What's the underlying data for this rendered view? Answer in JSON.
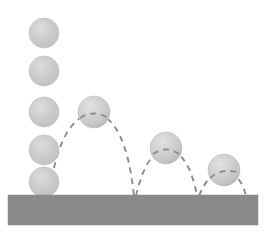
{
  "figure": {
    "width": 267,
    "height": 242,
    "background_color": "#ffffff"
  },
  "colors": {
    "ball_fill": "#c9c9c9",
    "ball_highlight": "#dedede",
    "ball_shadow": "#b4b4b4",
    "ball_edge": "#bdbdbd",
    "ground_fill": "#8a8a8a",
    "ground_edge": "#8a8a8a",
    "trajectory_stroke": "#8c8c8c"
  },
  "ground": {
    "label": "ground-surface",
    "x": 8,
    "y": 195,
    "width": 250,
    "height": 30,
    "top_y": 195
  },
  "drop_sequence": {
    "label": "free-fall-sphere-column",
    "count": 5,
    "center_x": 44,
    "radius": 15,
    "spheres": [
      {
        "name": "drop-sphere-1",
        "cx": 44,
        "cy": 33,
        "r": 15
      },
      {
        "name": "drop-sphere-2",
        "cx": 44,
        "cy": 71,
        "r": 15
      },
      {
        "name": "drop-sphere-3",
        "cx": 44,
        "cy": 112,
        "r": 15
      },
      {
        "name": "drop-sphere-4",
        "cx": 44,
        "cy": 150,
        "r": 15
      },
      {
        "name": "drop-sphere-5",
        "cx": 44,
        "cy": 182,
        "r": 15
      }
    ]
  },
  "bounce_sequence": {
    "label": "bounce-apex-spheres",
    "count": 3,
    "radius": 16,
    "spheres": [
      {
        "name": "bounce-sphere-1",
        "cx": 94,
        "cy": 112,
        "r": 16
      },
      {
        "name": "bounce-sphere-2",
        "cx": 166,
        "cy": 148,
        "r": 16
      },
      {
        "name": "bounce-sphere-3",
        "cx": 224,
        "cy": 170,
        "r": 16
      }
    ]
  },
  "impact_points": [
    {
      "name": "impact-point-1",
      "x": 44,
      "y": 195
    },
    {
      "name": "impact-point-2",
      "x": 134,
      "y": 196
    },
    {
      "name": "impact-point-3",
      "x": 197,
      "y": 196
    },
    {
      "name": "impact-point-4",
      "x": 246,
      "y": 196
    }
  ],
  "trajectories": [
    {
      "name": "arc-bounce-1",
      "start_x": 50,
      "start_y": 190,
      "apex_x": 94,
      "apex_y": 112,
      "end_x": 134,
      "end_y": 196,
      "path": "M 50 190 Q 60 118 94 112 Q 126 118 134 196"
    },
    {
      "name": "arc-bounce-2",
      "start_x": 136,
      "start_y": 196,
      "apex_x": 166,
      "apex_y": 148,
      "end_x": 197,
      "end_y": 196,
      "path": "M 136 196 Q 146 152 166 148 Q 189 152 197 196"
    },
    {
      "name": "arc-bounce-3",
      "start_x": 199,
      "start_y": 196,
      "apex_x": 224,
      "apex_y": 170,
      "end_x": 246,
      "end_y": 196,
      "path": "M 199 196 Q 208 173 224 170 Q 241 174 246 196"
    }
  ],
  "stroke_style": {
    "dash_pattern": "6 5",
    "width": 1.9,
    "linecap": "butt"
  }
}
